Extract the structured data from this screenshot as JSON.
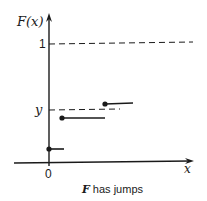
{
  "diagram": {
    "type": "step-function-plot",
    "y_axis_label": "F(x)",
    "x_axis_label": "x",
    "origin_label": "0",
    "level_one_label": "1",
    "level_y_label": "y",
    "caption_italic": "F",
    "caption_rest": " has jumps",
    "colors": {
      "ink": "#1a1a1a",
      "background": "#ffffff"
    },
    "segments": [
      {
        "x_start": 49,
        "x_end": 64,
        "y": 149
      },
      {
        "x_start": 62,
        "x_end": 105,
        "y": 118
      },
      {
        "x_start": 105,
        "x_end": 133,
        "y": 104
      }
    ],
    "dashed_lines": [
      {
        "name": "level-one",
        "y": 44,
        "x_start": 49,
        "x_end": 193
      },
      {
        "name": "level-y",
        "y": 110,
        "x_start": 49,
        "x_end": 120
      }
    ]
  }
}
